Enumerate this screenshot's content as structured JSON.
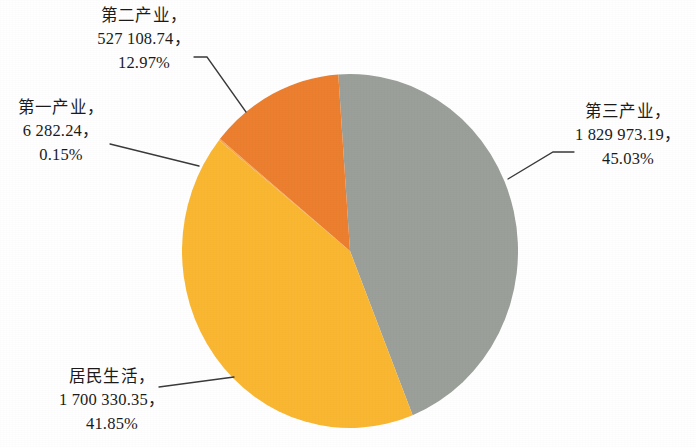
{
  "chart_data": {
    "type": "pie",
    "title": "",
    "subtitle": "",
    "legend_position": "none",
    "grid": false,
    "label_format": "name, value, percent",
    "categories": [
      "第二产业",
      "第一产业",
      "居民生活",
      "第三产业"
    ],
    "values": [
      527108.74,
      6282.24,
      1700330.35,
      1829973.19
    ],
    "percents": [
      12.97,
      0.15,
      41.85,
      45.03
    ],
    "colors": [
      "#ed7f2f",
      "#f8a94a",
      "#fbb731",
      "#9ba09b"
    ],
    "slices": [
      {
        "name": "第二产业",
        "value_text": "527 108.74",
        "percent_text": "12.97%",
        "value": 527108.74,
        "percent": 12.97,
        "color": "#ed7f2f"
      },
      {
        "name": "第一产业",
        "value_text": "6 282.24",
        "percent_text": "0.15%",
        "value": 6282.24,
        "percent": 0.15,
        "color": "#f8a94a"
      },
      {
        "name": "居民生活",
        "value_text": "1 700 330.35",
        "percent_text": "41.85%",
        "value": 1700330.35,
        "percent": 41.85,
        "color": "#fbb731"
      },
      {
        "name": "第三产业",
        "value_text": "1 829 973.19",
        "percent_text": "45.03%",
        "value": 1829973.19,
        "percent": 45.03,
        "color": "#9ba09b"
      }
    ]
  },
  "labels": {
    "secondary": {
      "line1": "第二产业，",
      "line2": "527 108.74，",
      "line3": "12.97%"
    },
    "primary": {
      "line1": "第一产业，",
      "line2": "6 282.24，",
      "line3": "0.15%"
    },
    "tertiary": {
      "line1": "第三产业，",
      "line2": "1 829 973.19，",
      "line3": "45.03%"
    },
    "residential": {
      "line1": "居民生活，",
      "line2": "1 700 330.35，",
      "line3": "41.85%"
    }
  },
  "colors": {
    "background": "#ffffff",
    "gray_slice": "#9ba09b",
    "orange_slice": "#ed7f2f",
    "yellow_slice": "#fbb731",
    "light_orange_slice": "#f8a94a",
    "leader_line": "#3a3a3a",
    "text": "#1b1b1b"
  }
}
